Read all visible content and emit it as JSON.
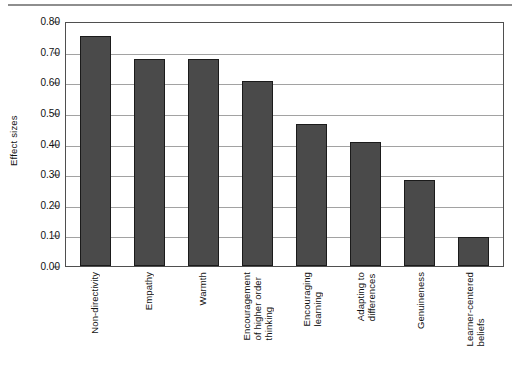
{
  "chart_data": {
    "type": "bar",
    "title": "",
    "xlabel": "",
    "ylabel": "Effect sizes",
    "ylim": [
      0.0,
      0.8
    ],
    "ytick_labels": [
      "0.80",
      "0.70",
      "0.60",
      "0.50",
      "0.40",
      "0.30",
      "0.20",
      "0.10",
      "0.00"
    ],
    "ytick_values": [
      0.8,
      0.7,
      0.6,
      0.5,
      0.4,
      0.3,
      0.2,
      0.1,
      0.0
    ],
    "grid": true,
    "legend": "none",
    "bar_color": "#4a4a4a",
    "bar_edge_color": "#1b1b1b",
    "categories": [
      "Non-directivity",
      "Empathy",
      "Warmth",
      "Encouragement\nof higher order\nthinking",
      "Encouraging\nlearning",
      "Adapting to\ndifferences",
      "Genuineness",
      "Learner-centered\nbeliefs"
    ],
    "values": [
      0.75,
      0.675,
      0.675,
      0.605,
      0.465,
      0.405,
      0.28,
      0.095
    ]
  }
}
